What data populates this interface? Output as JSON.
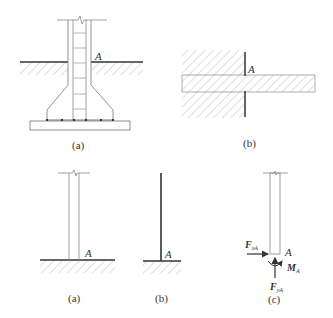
{
  "figure_top": {
    "panel_a": {
      "caption": "(a)",
      "point_label": "A",
      "description": "Reinforced concrete column with flared footing embedded in ground"
    },
    "panel_b": {
      "caption": "(b)",
      "point_label": "A",
      "description": "Cantilever beam built into a wall"
    }
  },
  "figure_bottom": {
    "panel_a": {
      "caption": "(a)",
      "point_label": "A",
      "description": "Column fixed at ground"
    },
    "panel_b": {
      "caption": "(b)",
      "point_label": "A",
      "description": "Line model of fixed support"
    },
    "panel_c": {
      "caption": "(c)",
      "point_label": "A",
      "forces": {
        "horizontal": {
          "symbol": "F",
          "subscript": "xA"
        },
        "vertical": {
          "symbol": "F",
          "subscript": "yA"
        },
        "moment": {
          "symbol": "M",
          "subscript": "A"
        }
      }
    }
  },
  "colors": {
    "line": "#555555",
    "thick_line": "#333333",
    "hatch": "#bbbbbb"
  }
}
